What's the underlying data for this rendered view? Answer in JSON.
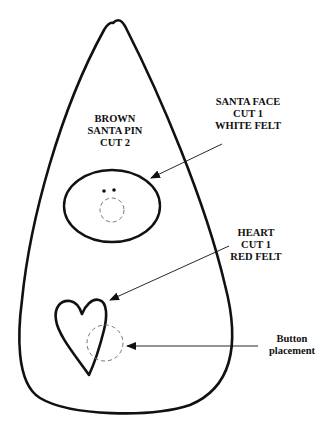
{
  "diagram": {
    "type": "sewing-pattern",
    "colors": {
      "stroke": "#111111",
      "dashed": "#777777",
      "background": "#ffffff"
    },
    "labels": {
      "body": [
        "BROWN",
        "SANTA PIN",
        "CUT 2"
      ],
      "face": [
        "SANTA FACE",
        "CUT 1",
        "WHITE FELT"
      ],
      "heart": [
        "HEART",
        "CUT 1",
        "RED FELT"
      ],
      "button": [
        "Button",
        "placement"
      ]
    },
    "pieces": [
      {
        "name": "santa-pin-body",
        "shape": "teardrop"
      },
      {
        "name": "santa-face",
        "shape": "ellipse"
      },
      {
        "name": "heart",
        "shape": "heart"
      },
      {
        "name": "button-placement",
        "shape": "dashed-circle"
      }
    ]
  }
}
